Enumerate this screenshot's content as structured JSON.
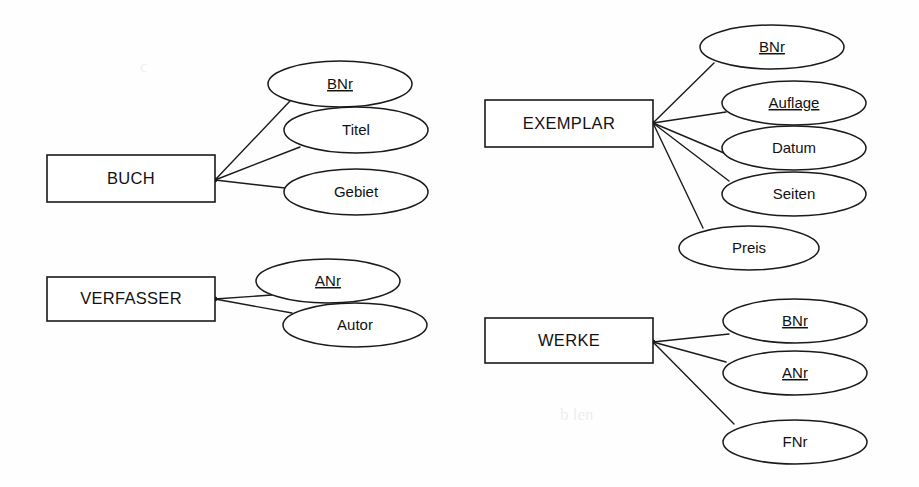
{
  "diagram": {
    "type": "entity-relationship",
    "background_color": "#fefefe",
    "line_color": "#1a1a1a",
    "text_color": "#111111",
    "width": 919,
    "height": 487
  },
  "entities": [
    {
      "id": "buch",
      "name": "BUCH",
      "box": {
        "x": 47,
        "y": 155,
        "w": 168,
        "h": 47
      },
      "hub": {
        "x": 215,
        "y": 180
      },
      "attributes": [
        {
          "name": "BNr",
          "key": true,
          "ellipse": {
            "cx": 340,
            "cy": 84,
            "rx": 72,
            "ry": 23
          },
          "anchor": {
            "x": 290,
            "y": 101
          }
        },
        {
          "name": "Titel",
          "key": false,
          "ellipse": {
            "cx": 356,
            "cy": 130,
            "rx": 72,
            "ry": 23
          },
          "anchor": {
            "x": 300,
            "y": 147
          }
        },
        {
          "name": "Gebiet",
          "key": false,
          "ellipse": {
            "cx": 356,
            "cy": 192,
            "rx": 72,
            "ry": 23
          },
          "anchor": {
            "x": 285,
            "y": 188
          }
        }
      ]
    },
    {
      "id": "verfasser",
      "name": "VERFASSER",
      "box": {
        "x": 47,
        "y": 277,
        "w": 168,
        "h": 44
      },
      "hub": {
        "x": 215,
        "y": 299
      },
      "attributes": [
        {
          "name": "ANr",
          "key": true,
          "ellipse": {
            "cx": 328,
            "cy": 281,
            "rx": 72,
            "ry": 22
          },
          "anchor": {
            "x": 272,
            "y": 295
          }
        },
        {
          "name": "Autor",
          "key": false,
          "ellipse": {
            "cx": 355,
            "cy": 325,
            "rx": 72,
            "ry": 22
          },
          "anchor": {
            "x": 292,
            "y": 313
          }
        }
      ]
    },
    {
      "id": "exemplar",
      "name": "EXEMPLAR",
      "box": {
        "x": 485,
        "y": 100,
        "w": 168,
        "h": 47
      },
      "hub": {
        "x": 653,
        "y": 123
      },
      "attributes": [
        {
          "name": "BNr",
          "key": true,
          "ellipse": {
            "cx": 772,
            "cy": 47,
            "rx": 72,
            "ry": 22
          },
          "anchor": {
            "x": 714,
            "y": 63
          }
        },
        {
          "name": "Auflage",
          "key": true,
          "ellipse": {
            "cx": 794,
            "cy": 103,
            "rx": 72,
            "ry": 22
          },
          "anchor": {
            "x": 726,
            "y": 112
          }
        },
        {
          "name": "Datum",
          "key": false,
          "ellipse": {
            "cx": 794,
            "cy": 148,
            "rx": 72,
            "ry": 22
          },
          "anchor": {
            "x": 724,
            "y": 153
          }
        },
        {
          "name": "Seiten",
          "key": false,
          "ellipse": {
            "cx": 794,
            "cy": 194,
            "rx": 72,
            "ry": 22
          },
          "anchor": {
            "x": 729,
            "y": 181
          }
        },
        {
          "name": "Preis",
          "key": false,
          "ellipse": {
            "cx": 749,
            "cy": 248,
            "rx": 70,
            "ry": 22
          },
          "anchor": {
            "x": 703,
            "y": 228
          }
        }
      ]
    },
    {
      "id": "werke",
      "name": "WERKE",
      "box": {
        "x": 485,
        "y": 318,
        "w": 168,
        "h": 45
      },
      "hub": {
        "x": 653,
        "y": 342
      },
      "attributes": [
        {
          "name": "BNr",
          "key": true,
          "ellipse": {
            "cx": 795,
            "cy": 321,
            "rx": 72,
            "ry": 22
          },
          "anchor": {
            "x": 729,
            "y": 334
          }
        },
        {
          "name": "ANr",
          "key": true,
          "ellipse": {
            "cx": 795,
            "cy": 373,
            "rx": 72,
            "ry": 22
          },
          "anchor": {
            "x": 726,
            "y": 362
          }
        },
        {
          "name": "FNr",
          "key": false,
          "ellipse": {
            "cx": 795,
            "cy": 442,
            "rx": 72,
            "ry": 22
          },
          "anchor": {
            "x": 734,
            "y": 424
          }
        }
      ]
    }
  ]
}
